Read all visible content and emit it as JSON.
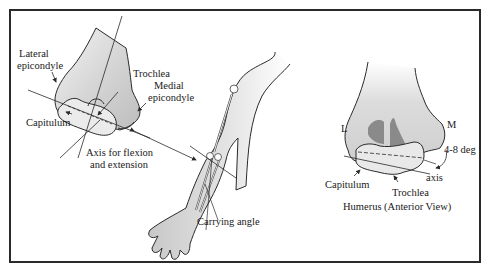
{
  "figure": {
    "left_panel": {
      "labels": {
        "lateral_epicondyle_1": "Lateral",
        "lateral_epicondyle_2": "epicondyle",
        "trochlea": "Trochlea",
        "medial_epicondyle_1": "Medial",
        "medial_epicondyle_2": "epicondyle",
        "capitulum": "Capitulum",
        "axis_1": "Axis for flexion",
        "axis_2": "and extension",
        "carrying_angle": "Carrying angle"
      }
    },
    "right_panel": {
      "labels": {
        "lateral": "L",
        "medial": "M",
        "angle": "4-8 deg",
        "axis": "axis",
        "capitulum": "Capitulum",
        "trochlea": "Trochlea",
        "caption": "Humerus (Anterior View)"
      }
    },
    "colors": {
      "bone_fill": "#d9d9d9",
      "dark_fill": "#8a8a8a",
      "line": "#2a2a2a"
    }
  }
}
